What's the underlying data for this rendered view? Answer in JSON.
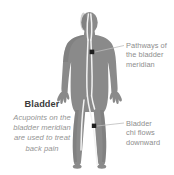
{
  "diagram": {
    "type": "anatomical-meridian-illustration",
    "view": "posterior-rear-view-human-body",
    "background_color": "#ffffff",
    "body_color": "#8a8a8a",
    "body_shadow_color": "#6f6f6f",
    "meridian_line_color": "#f2f2f2",
    "acupoint_color": "#1f1f1f",
    "leader_line_color": "#bdbdbd",
    "callout_text_color": "#8d8d8d",
    "heading_text_color": "#3b3b3b",
    "body_text_color": "#949494"
  },
  "callouts": [
    {
      "name": "pathways",
      "lines": [
        "Pathways of",
        "the bladder",
        "meridian"
      ],
      "text": "Pathways of the bladder meridian",
      "anchor_point": {
        "x": 92,
        "y": 52
      }
    },
    {
      "name": "chi-flow",
      "lines": [
        "Bladder",
        "chi flows",
        "downward"
      ],
      "text": "Bladder chi flows downward",
      "anchor_point": {
        "x": 94,
        "y": 126
      }
    }
  ],
  "left_block": {
    "title": "Bladder",
    "lines": [
      "Acupoints on the",
      "bladder meridian",
      "are used to treat",
      "back pain"
    ],
    "text": "Acupoints on the bladder meridian are used to treat back pain"
  }
}
